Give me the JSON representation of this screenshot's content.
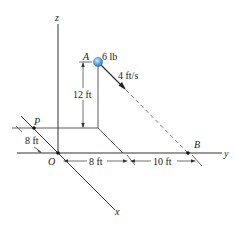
{
  "diagram": {
    "axes": {
      "x": "x",
      "y": "y",
      "z": "z"
    },
    "points": {
      "origin": "O",
      "P": "P",
      "A": "A",
      "B": "B"
    },
    "ball": {
      "weight": "6 lb",
      "color": "#5aa7e0"
    },
    "velocity": "4 ft/s",
    "dimensions": {
      "height": "12 ft",
      "P_offset": "8 ft",
      "y_to_A": "8 ft",
      "A_to_B": "10 ft"
    }
  }
}
